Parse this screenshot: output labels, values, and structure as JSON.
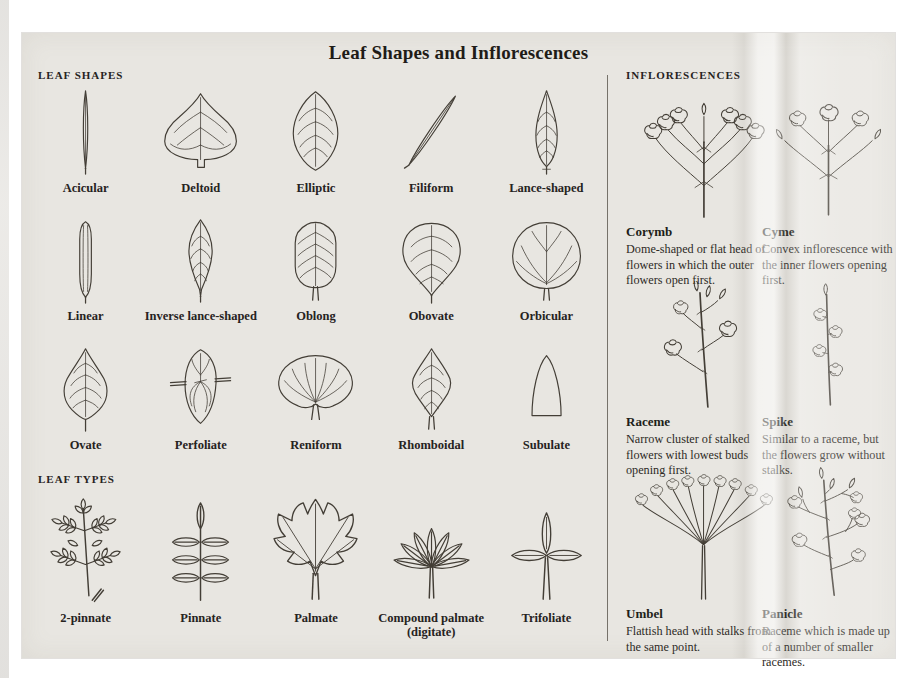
{
  "page": {
    "title": "Leaf Shapes and Inflorescences"
  },
  "leaf_shapes": {
    "heading": "LEAF SHAPES",
    "items": [
      {
        "label": "Acicular"
      },
      {
        "label": "Deltoid"
      },
      {
        "label": "Elliptic"
      },
      {
        "label": "Filiform"
      },
      {
        "label": "Lance-shaped"
      },
      {
        "label": "Linear"
      },
      {
        "label": "Inverse lance-shaped"
      },
      {
        "label": "Oblong"
      },
      {
        "label": "Obovate"
      },
      {
        "label": "Orbicular"
      },
      {
        "label": "Ovate"
      },
      {
        "label": "Perfoliate"
      },
      {
        "label": "Reniform"
      },
      {
        "label": "Rhomboidal"
      },
      {
        "label": "Subulate"
      }
    ]
  },
  "leaf_types": {
    "heading": "LEAF TYPES",
    "items": [
      {
        "label": "2-pinnate"
      },
      {
        "label": "Pinnate"
      },
      {
        "label": "Palmate"
      },
      {
        "label": "Compound palmate",
        "sublabel": "(digitate)"
      },
      {
        "label": "Trifoliate"
      }
    ]
  },
  "inflorescences": {
    "heading": "INFLORESCENCES",
    "items": [
      {
        "name": "Corymb",
        "description": "Dome-shaped or flat head of flowers in which the outer flowers open first."
      },
      {
        "name": "Cyme",
        "description": "Convex inflorescence with the inner flowers opening first."
      },
      {
        "name": "Raceme",
        "description": "Narrow cluster of stalked flowers with lowest buds opening first."
      },
      {
        "name": "Spike",
        "description": "Similar to a raceme, but the flowers grow without stalks."
      },
      {
        "name": "Umbel",
        "description": "Flattish head with stalks from the same point."
      },
      {
        "name": "Panicle",
        "description": "Raceme which is made up of a number of smaller racemes."
      }
    ]
  },
  "colors": {
    "page_bg": "#e8e6e1",
    "ink": "#26231e",
    "line": "#433e36"
  }
}
